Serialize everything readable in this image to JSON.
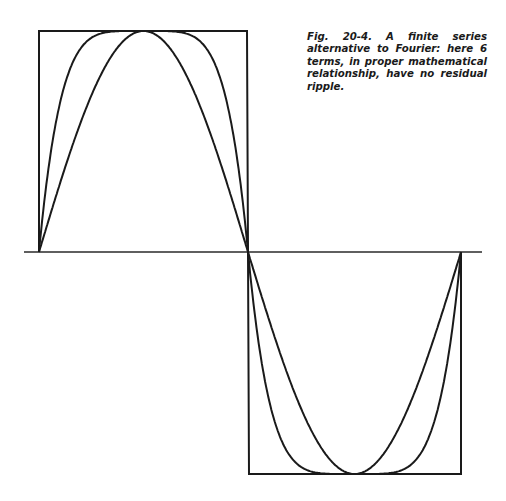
{
  "figure": {
    "caption": "Fig. 20-4. A finite series alternative to Fourier: here 6 terms, in proper mathematical relationship, have no residual ripple.",
    "elements": [
      "square-wave",
      "sine-like-curve",
      "six-term-series-curve",
      "horizontal-axis"
    ],
    "colors": {
      "ink": "#1a1a1a",
      "background": "#ffffff"
    }
  }
}
